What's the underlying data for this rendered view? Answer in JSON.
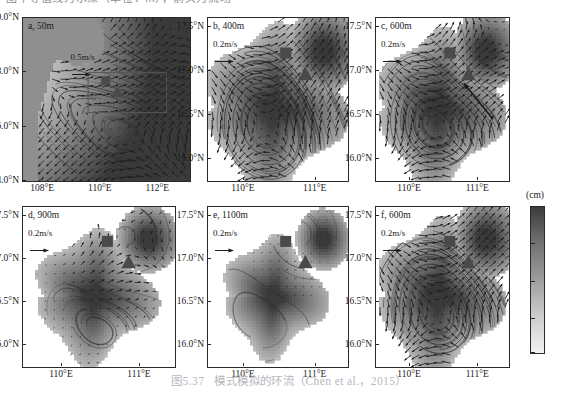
{
  "header": {
    "cropped_text": "图中等值线为水深（单位：m），箭头为流场"
  },
  "caption": {
    "number": "图5.37",
    "text": "模式模拟的环流（Chen et al.，2015）"
  },
  "colorbar": {
    "unit": "(cm)",
    "ticks": [
      "2000",
      "1500",
      "1000",
      "500",
      "50"
    ],
    "tick_values": [
      2000,
      1500,
      1000,
      500,
      50
    ],
    "min": 50,
    "max": 2000,
    "high_color": "#3a3a3a",
    "low_color": "#f2f2f2",
    "orientation": "vertical",
    "high_at": "top"
  },
  "panels": [
    {
      "id": "a",
      "label": "a, 50m",
      "depth_m": 50,
      "vector_scale_label": "0.5m/s",
      "vector_scale_value": 0.5,
      "yticks": [
        "20.0°N",
        "18.0°N",
        "16.0°N",
        "14.0°N"
      ],
      "ytick_values": [
        20.0,
        18.0,
        16.0,
        14.0
      ],
      "xticks": [
        "108°E",
        "110°E",
        "112°E"
      ],
      "xtick_values": [
        108,
        110,
        112
      ],
      "ylim": [
        14.0,
        20.0
      ],
      "xlim": [
        107.3,
        113.1
      ],
      "has_inset_box": true,
      "markers": [
        "square",
        "triangle"
      ]
    },
    {
      "id": "b",
      "label": "b, 400m",
      "depth_m": 400,
      "vector_scale_label": "0.2m/s",
      "vector_scale_value": 0.2,
      "yticks": [
        "17.5°N",
        "17.0°N",
        "16.5°N",
        "16.0°N"
      ],
      "ytick_values": [
        17.5,
        17.0,
        16.5,
        16.0
      ],
      "xticks": [
        "110°E",
        "111°E"
      ],
      "xtick_values": [
        110,
        111
      ],
      "ylim": [
        15.75,
        17.6
      ],
      "xlim": [
        109.5,
        111.45
      ],
      "has_inset_box": false,
      "markers": [
        "square",
        "triangle"
      ]
    },
    {
      "id": "c",
      "label": "c, 600m",
      "depth_m": 600,
      "vector_scale_label": "0.2m/s",
      "vector_scale_value": 0.2,
      "yticks": [
        "17.5°N",
        "17.0°N",
        "16.5°N",
        "16.0°N"
      ],
      "ytick_values": [
        17.5,
        17.0,
        16.5,
        16.0
      ],
      "xticks": [
        "110°E",
        "111°E"
      ],
      "xtick_values": [
        110,
        111
      ],
      "ylim": [
        15.75,
        17.6
      ],
      "xlim": [
        109.5,
        111.45
      ],
      "has_inset_box": false,
      "markers": [
        "square",
        "triangle"
      ]
    },
    {
      "id": "d",
      "label": "d, 900m",
      "depth_m": 900,
      "vector_scale_label": "0.2m/s",
      "vector_scale_value": 0.2,
      "yticks": [
        "17.5°N",
        "17.0°N",
        "16.5°N",
        "16.0°N"
      ],
      "ytick_values": [
        17.5,
        17.0,
        16.5,
        16.0
      ],
      "xticks": [
        "110°E",
        "111°E"
      ],
      "xtick_values": [
        110,
        111
      ],
      "ylim": [
        15.75,
        17.6
      ],
      "xlim": [
        109.5,
        111.45
      ],
      "has_inset_box": false,
      "markers": [
        "square",
        "triangle"
      ]
    },
    {
      "id": "e",
      "label": "e, 1100m",
      "depth_m": 1100,
      "vector_scale_label": "0.2m/s",
      "vector_scale_value": 0.2,
      "yticks": [
        "17.5°N",
        "17.0°N",
        "16.5°N",
        "16.0°N"
      ],
      "ytick_values": [
        17.5,
        17.0,
        16.5,
        16.0
      ],
      "xticks": [
        "110°E",
        "111°E"
      ],
      "xtick_values": [
        110,
        111
      ],
      "ylim": [
        15.75,
        17.6
      ],
      "xlim": [
        109.5,
        111.45
      ],
      "has_inset_box": false,
      "markers": [
        "square",
        "triangle"
      ]
    },
    {
      "id": "f",
      "label": "f, 600m",
      "depth_m": 600,
      "vector_scale_label": "0.2m/s",
      "vector_scale_value": 0.2,
      "yticks": [
        "17.5°N",
        "17.0°N",
        "16.5°N",
        "16.0°N"
      ],
      "ytick_values": [
        17.5,
        17.0,
        16.5,
        16.0
      ],
      "xticks": [
        "110°E",
        "111°E"
      ],
      "xtick_values": [
        110,
        111
      ],
      "ylim": [
        15.75,
        17.6
      ],
      "xlim": [
        109.5,
        111.45
      ],
      "has_inset_box": false,
      "markers": [
        "square",
        "triangle"
      ]
    }
  ],
  "marker_style": {
    "square_color": "#4a4a4a",
    "triangle_color": "#4a4a4a"
  },
  "chart_data": {
    "type": "heatmap",
    "title": "模式模拟的环流（Chen et al.，2015）",
    "xlabel": "Longitude",
    "ylabel": "Latitude",
    "panel_count": 6,
    "grid": false,
    "legend": "colorbar-right",
    "colorbar_label": "(cm)",
    "colorbar_range": [
      50,
      2000
    ],
    "depths_m": [
      50,
      400,
      600,
      900,
      1100,
      600
    ],
    "panel_ids": [
      "a",
      "b",
      "c",
      "d",
      "e",
      "f"
    ],
    "vector_scales_m_s": [
      0.5,
      0.2,
      0.2,
      0.2,
      0.2,
      0.2
    ],
    "region": {
      "lon_range_panel_a": [
        107.3,
        113.1
      ],
      "lat_range_panel_a": [
        14.0,
        20.0
      ],
      "lon_range_panels_bcdef": [
        109.5,
        111.45
      ],
      "lat_range_panels_bcdef": [
        15.75,
        17.6
      ]
    }
  }
}
